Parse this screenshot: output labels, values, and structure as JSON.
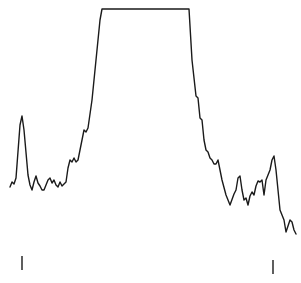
{
  "chart_data": {
    "type": "line",
    "title": "",
    "xlabel": "",
    "ylabel": "",
    "grid": false,
    "legend": null,
    "axes_visible": false,
    "line_color": "#1a1a1a",
    "background": "#ffffff",
    "series": [
      {
        "name": "trace",
        "pixel_points": [
          [
            10,
            187
          ],
          [
            12,
            182
          ],
          [
            14,
            184
          ],
          [
            16,
            178
          ],
          [
            20,
            125
          ],
          [
            22,
            116
          ],
          [
            24,
            130
          ],
          [
            28,
            175
          ],
          [
            30,
            185
          ],
          [
            32,
            190
          ],
          [
            34,
            182
          ],
          [
            36,
            176
          ],
          [
            38,
            183
          ],
          [
            40,
            186
          ],
          [
            42,
            190
          ],
          [
            44,
            190
          ],
          [
            48,
            180
          ],
          [
            50,
            178
          ],
          [
            52,
            183
          ],
          [
            54,
            180
          ],
          [
            56,
            185
          ],
          [
            58,
            187
          ],
          [
            60,
            182
          ],
          [
            62,
            186
          ],
          [
            64,
            184
          ],
          [
            66,
            182
          ],
          [
            68,
            168
          ],
          [
            70,
            160
          ],
          [
            72,
            162
          ],
          [
            74,
            158
          ],
          [
            76,
            162
          ],
          [
            78,
            160
          ],
          [
            80,
            150
          ],
          [
            84,
            130
          ],
          [
            86,
            132
          ],
          [
            88,
            128
          ],
          [
            92,
            100
          ],
          [
            96,
            60
          ],
          [
            100,
            20
          ],
          [
            102,
            9
          ],
          [
            189,
            9
          ],
          [
            192,
            60
          ],
          [
            196,
            96
          ],
          [
            198,
            98
          ],
          [
            200,
            118
          ],
          [
            202,
            120
          ],
          [
            204,
            140
          ],
          [
            206,
            150
          ],
          [
            208,
            152
          ],
          [
            210,
            158
          ],
          [
            212,
            160
          ],
          [
            214,
            164
          ],
          [
            216,
            164
          ],
          [
            218,
            160
          ],
          [
            220,
            170
          ],
          [
            222,
            180
          ],
          [
            226,
            195
          ],
          [
            230,
            205
          ],
          [
            234,
            194
          ],
          [
            236,
            190
          ],
          [
            238,
            178
          ],
          [
            240,
            176
          ],
          [
            242,
            190
          ],
          [
            244,
            200
          ],
          [
            246,
            198
          ],
          [
            248,
            205
          ],
          [
            250,
            196
          ],
          [
            252,
            192
          ],
          [
            254,
            195
          ],
          [
            256,
            186
          ],
          [
            258,
            181
          ],
          [
            260,
            182
          ],
          [
            262,
            180
          ],
          [
            264,
            195
          ],
          [
            266,
            180
          ],
          [
            270,
            170
          ],
          [
            272,
            160
          ],
          [
            274,
            156
          ],
          [
            276,
            170
          ],
          [
            280,
            210
          ],
          [
            282,
            215
          ],
          [
            284,
            220
          ],
          [
            286,
            232
          ],
          [
            288,
            226
          ],
          [
            290,
            220
          ],
          [
            292,
            222
          ],
          [
            294,
            230
          ],
          [
            296,
            234
          ]
        ]
      }
    ],
    "features": {
      "left_peak": {
        "x": 22,
        "y": 116
      },
      "plateau": {
        "x_start": 102,
        "x_end": 189,
        "y": 9,
        "note": "clipped/saturated top"
      },
      "right_peak": {
        "x": 274,
        "y": 156
      }
    },
    "markers": [
      {
        "name": "left-marker",
        "x": 22,
        "y1": 256,
        "y2": 270
      },
      {
        "name": "right-marker",
        "x": 273,
        "y1": 260,
        "y2": 274
      }
    ]
  }
}
